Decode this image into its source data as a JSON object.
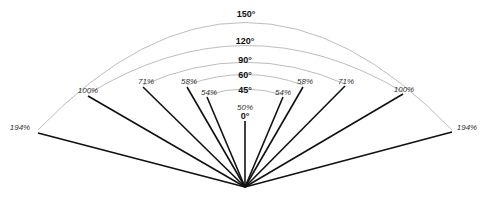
{
  "diagram": {
    "origin": [
      245,
      187
    ],
    "arc_color": "#bdbdbd",
    "line_color": "#111111",
    "arcs": [
      {
        "label": "150°",
        "label_pos": [
          246,
          14
        ],
        "path": "M 38 130 Q 245 -85 452 130"
      },
      {
        "label": "120°",
        "label_pos": [
          245,
          41
        ],
        "path": "M 88 94 Q 245 -2 403 92"
      },
      {
        "label": "90°",
        "label_pos": [
          245,
          60
        ],
        "path": "M 143 85 Q 245 40 345 84"
      },
      {
        "label": "60°",
        "label_pos": [
          245,
          75
        ],
        "path": "M 187 85 Q 245 64 303 85"
      },
      {
        "label": "45°",
        "label_pos": [
          245,
          90
        ],
        "path": "M 207 95 Q 245 83 283 95"
      }
    ],
    "zero_label": {
      "label": "0°",
      "pos": [
        245,
        116
      ]
    },
    "center_pct": {
      "label": "50%",
      "pos": [
        245,
        107
      ]
    },
    "lines": [
      {
        "name": "194-left",
        "pct": "194%",
        "end": [
          38,
          133
        ],
        "label_pos": [
          20,
          127
        ]
      },
      {
        "name": "100-left",
        "pct": "100%",
        "end": [
          88,
          96
        ],
        "label_pos": [
          88,
          90
        ]
      },
      {
        "name": "71-left",
        "pct": "71%",
        "end": [
          143,
          87
        ],
        "label_pos": [
          146,
          81
        ]
      },
      {
        "name": "58-left",
        "pct": "58%",
        "end": [
          187,
          87
        ],
        "label_pos": [
          189,
          81
        ]
      },
      {
        "name": "54-left",
        "pct": "54%",
        "end": [
          207,
          97
        ],
        "label_pos": [
          209,
          92
        ]
      },
      {
        "name": "zero",
        "pct": "",
        "end": [
          245,
          121
        ],
        "label_pos": [
          0,
          0
        ]
      },
      {
        "name": "54-right",
        "pct": "54%",
        "end": [
          283,
          97
        ],
        "label_pos": [
          283,
          92
        ]
      },
      {
        "name": "58-right",
        "pct": "58%",
        "end": [
          303,
          87
        ],
        "label_pos": [
          305,
          81
        ]
      },
      {
        "name": "71-right",
        "pct": "71%",
        "end": [
          345,
          86
        ],
        "label_pos": [
          346,
          81
        ]
      },
      {
        "name": "100-right",
        "pct": "100%",
        "end": [
          403,
          94
        ],
        "label_pos": [
          404,
          89
        ]
      },
      {
        "name": "194-right",
        "pct": "194%",
        "end": [
          452,
          132
        ],
        "label_pos": [
          467,
          127
        ]
      }
    ]
  }
}
